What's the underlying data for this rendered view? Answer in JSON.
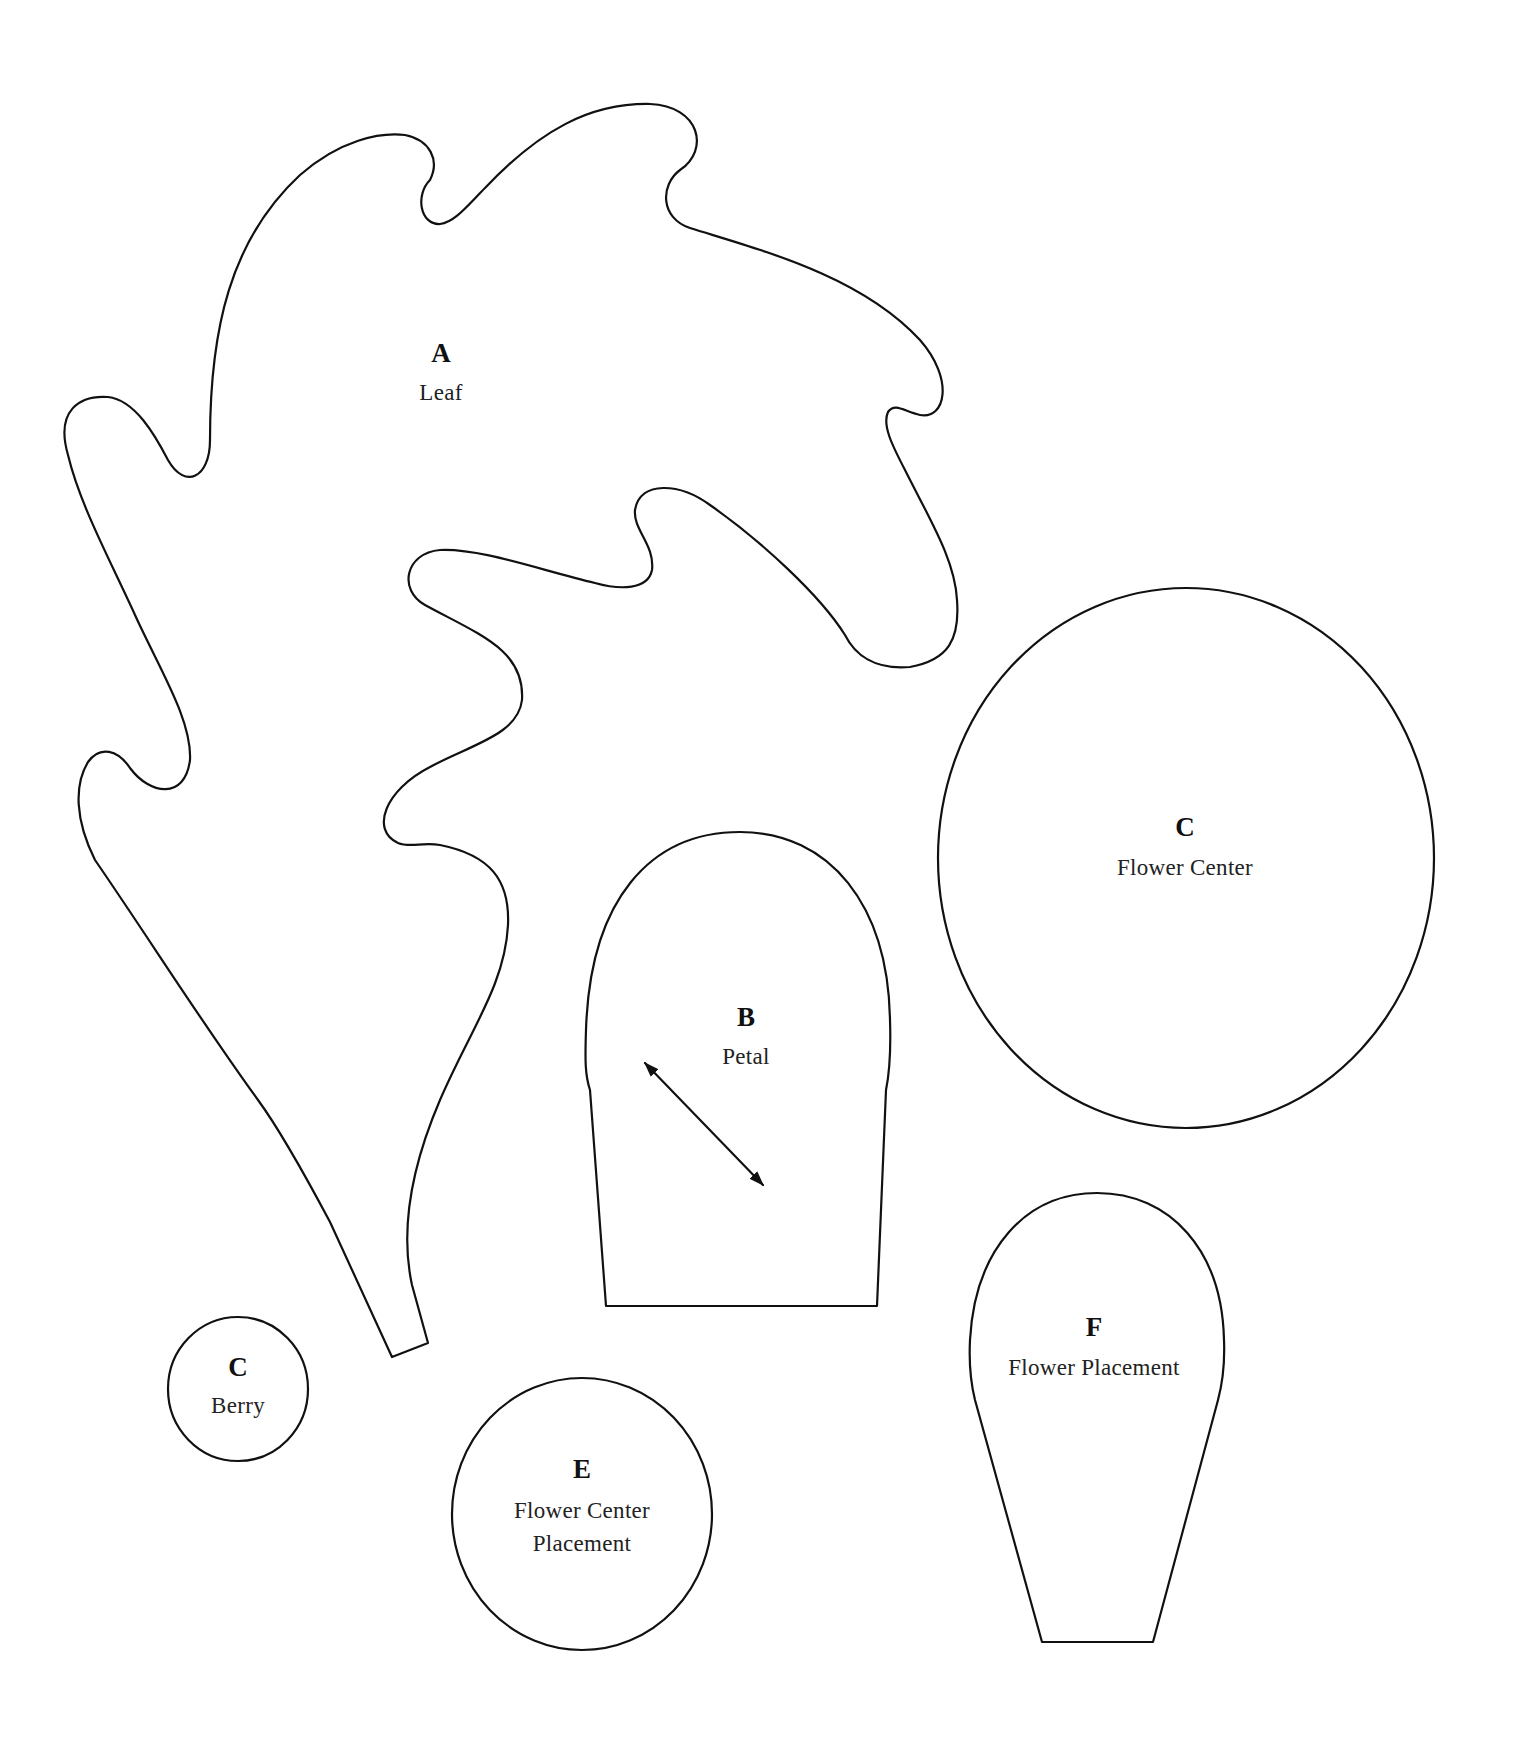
{
  "page": {
    "background": "#ffffff",
    "stroke_color": "#111111"
  },
  "pieces": {
    "leaf": {
      "letter": "A",
      "name": "Leaf"
    },
    "petal": {
      "letter": "B",
      "name": "Petal",
      "grain_arrow": "double-headed-arrow"
    },
    "flower_center": {
      "letter": "C",
      "name": "Flower Center"
    },
    "berry": {
      "letter": "C",
      "name": "Berry"
    },
    "flower_center_placement": {
      "letter": "E",
      "name_line1": "Flower Center",
      "name_line2": "Placement"
    },
    "flower_placement": {
      "letter": "F",
      "name": "Flower Placement"
    }
  }
}
